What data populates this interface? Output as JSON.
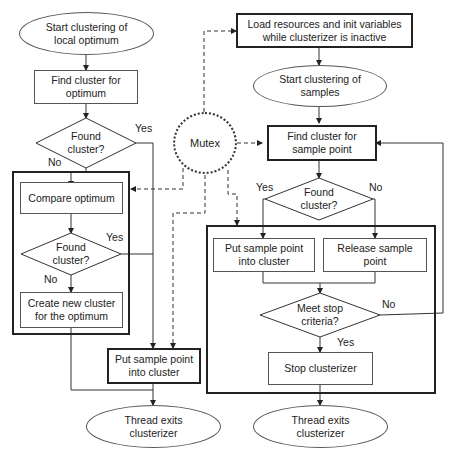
{
  "left_flow": {
    "start": "Start clustering of\nlocal optimum",
    "find": "Find cluster for\noptimum",
    "decision1": "Found\ncluster?",
    "decision1_yes": "Yes",
    "decision1_no": "No",
    "compare": "Compare optimum",
    "decision2": "Found\ncluster?",
    "decision2_yes": "Yes",
    "decision2_no": "No",
    "create": "Create new cluster\nfor the optimum",
    "put": "Put sample point\ninto cluster",
    "exit": "Thread exits\nclusterizer"
  },
  "mutex": {
    "label": "Mutex"
  },
  "right_flow": {
    "load": "Load resources and init variables\nwhile clusterizer is inactive",
    "start": "Start clustering of\nsamples",
    "find": "Find cluster for\nsample point",
    "decision1": "Found\ncluster?",
    "decision1_yes": "Yes",
    "decision1_no": "No",
    "put": "Put sample point\ninto cluster",
    "release": "Release sample\npoint",
    "decision2": "Meet stop\ncriteria?",
    "decision2_yes": "Yes",
    "decision2_no": "No",
    "stop": "Stop clusterizer",
    "exit": "Thread exits\nclusterizer"
  },
  "colors": {
    "line": "#333333",
    "border": "#555555",
    "bold_border": "#222222"
  }
}
